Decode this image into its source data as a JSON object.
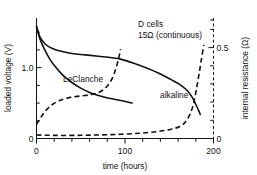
{
  "chart_data": {
    "type": "line",
    "title": "",
    "annotations": [
      {
        "id": "cell-type",
        "text": "D cells",
        "x": 118,
        "y": 1.53
      },
      {
        "id": "load-condition",
        "text": "15Ω (continuous)",
        "x": 118,
        "y": 1.4
      },
      {
        "id": "leclanche-label",
        "text": "LeClanche",
        "x": 48,
        "y": 0.86
      },
      {
        "id": "alkaline-label",
        "text": "alkaline",
        "x": 150,
        "y": 0.62
      }
    ],
    "xlabel": "time (hours)",
    "xlim": [
      0,
      200
    ],
    "xticks": [
      0,
      100,
      200
    ],
    "xticklabels": [
      "0",
      "100",
      "200"
    ],
    "xminorticks": [
      20,
      40,
      60,
      80,
      120,
      140,
      160,
      180
    ],
    "ylabel_left": "loaded voltage (V)",
    "ylim_left": [
      0,
      1.7
    ],
    "yticks_left": [
      0,
      1.0
    ],
    "yticklabels_left": [
      "0",
      "1.0"
    ],
    "yminorticks_left": [
      0.25,
      0.5,
      0.75,
      1.25,
      1.5
    ],
    "ylabel_right": "internal resistance (Ω)",
    "ylim_right": [
      0,
      0.85
    ],
    "yticks_right": [
      0,
      0.5
    ],
    "yticklabels_right": [
      "0",
      "0.5"
    ],
    "yminorticks_right": [
      0.1,
      0.2,
      0.3,
      0.4,
      0.6,
      0.7,
      0.8
    ],
    "grid": false,
    "legend": "inline-labels",
    "series": [
      {
        "name": "alkaline loaded voltage",
        "axis": "left",
        "style": "solid",
        "unit": "V",
        "points": [
          [
            0,
            1.58
          ],
          [
            4,
            1.43
          ],
          [
            10,
            1.33
          ],
          [
            18,
            1.27
          ],
          [
            28,
            1.23
          ],
          [
            40,
            1.2
          ],
          [
            55,
            1.18
          ],
          [
            70,
            1.16
          ],
          [
            85,
            1.14
          ],
          [
            95,
            1.12
          ],
          [
            110,
            1.06
          ],
          [
            125,
            0.99
          ],
          [
            140,
            0.91
          ],
          [
            152,
            0.83
          ],
          [
            162,
            0.76
          ],
          [
            170,
            0.68
          ],
          [
            176,
            0.58
          ],
          [
            180,
            0.48
          ],
          [
            183,
            0.4
          ],
          [
            185,
            0.34
          ]
        ]
      },
      {
        "name": "LeClanche loaded voltage",
        "axis": "left",
        "style": "solid",
        "unit": "V",
        "points": [
          [
            0,
            1.58
          ],
          [
            4,
            1.4
          ],
          [
            9,
            1.26
          ],
          [
            15,
            1.12
          ],
          [
            22,
            1.0
          ],
          [
            30,
            0.89
          ],
          [
            40,
            0.79
          ],
          [
            50,
            0.71
          ],
          [
            60,
            0.65
          ],
          [
            72,
            0.6
          ],
          [
            85,
            0.56
          ],
          [
            98,
            0.53
          ],
          [
            108,
            0.5
          ]
        ]
      },
      {
        "name": "LeClanche internal resistance",
        "axis": "right",
        "style": "dashed",
        "unit": "Ω",
        "points": [
          [
            0,
            0.1
          ],
          [
            5,
            0.15
          ],
          [
            11,
            0.2
          ],
          [
            18,
            0.24
          ],
          [
            27,
            0.27
          ],
          [
            38,
            0.29
          ],
          [
            50,
            0.3
          ],
          [
            62,
            0.31
          ],
          [
            72,
            0.33
          ],
          [
            80,
            0.37
          ],
          [
            86,
            0.43
          ],
          [
            90,
            0.5
          ],
          [
            93,
            0.57
          ],
          [
            95,
            0.63
          ]
        ]
      },
      {
        "name": "alkaline internal resistance",
        "axis": "right",
        "style": "dashed",
        "unit": "Ω",
        "points": [
          [
            0,
            0.025
          ],
          [
            20,
            0.022
          ],
          [
            45,
            0.022
          ],
          [
            70,
            0.025
          ],
          [
            95,
            0.03
          ],
          [
            118,
            0.038
          ],
          [
            138,
            0.05
          ],
          [
            152,
            0.065
          ],
          [
            162,
            0.085
          ],
          [
            168,
            0.115
          ],
          [
            173,
            0.165
          ],
          [
            177,
            0.235
          ],
          [
            180,
            0.325
          ],
          [
            183,
            0.43
          ],
          [
            186,
            0.545
          ],
          [
            189,
            0.66
          ]
        ]
      }
    ]
  }
}
